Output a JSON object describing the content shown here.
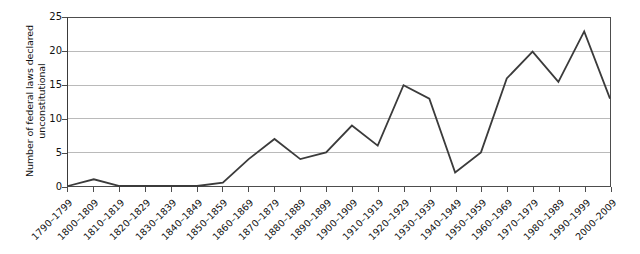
{
  "chart_data": {
    "type": "line",
    "title": "",
    "xlabel": "",
    "ylabel": "Number of federal laws declared\nunconstitutional",
    "ylim": [
      0,
      25
    ],
    "yticks": [
      0,
      5,
      10,
      15,
      20,
      25
    ],
    "ytick_labels": [
      "0",
      "5",
      "10",
      "15",
      "20",
      "25"
    ],
    "grid": "horizontal",
    "legend": "none",
    "line_color": "#3b3b3b",
    "grid_color": "#b9b9b9",
    "axis_color": "#4d4d4d",
    "categories": [
      "1790–1799",
      "1800–1809",
      "1810–1819",
      "1820–1829",
      "1830–1839",
      "1840–1849",
      "1850–1859",
      "1860–1869",
      "1870–1879",
      "1880–1889",
      "1890–1899",
      "1900–1909",
      "1910–1919",
      "1920–1929",
      "1930–1939",
      "1940–1949",
      "1950–1959",
      "1960–1969",
      "1970–1979",
      "1980–1989",
      "1990–1999",
      "2000–2009"
    ],
    "values": [
      0,
      1,
      0,
      0,
      0,
      0,
      0.5,
      4,
      7,
      4,
      5,
      9,
      6,
      15,
      13,
      2,
      5,
      16,
      20,
      15.5,
      23,
      13
    ]
  }
}
